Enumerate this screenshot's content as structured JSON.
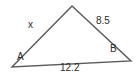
{
  "figure": {
    "type": "triangle-diagram",
    "stroke_color": "#5a5a5a",
    "text_color": "#2b2b2b",
    "background_color": "#ffffff",
    "vertices": [
      {
        "id": "apex",
        "label": "",
        "x": 72,
        "y": 6
      },
      {
        "id": "right",
        "label": "B",
        "x": 131,
        "y": 61
      },
      {
        "id": "left",
        "label": "A",
        "x": 12,
        "y": 67
      }
    ],
    "vertex_labels": {
      "a": "A",
      "b": "B"
    },
    "side_labels": {
      "left": "x",
      "right": "8.5",
      "base": "12.2"
    }
  }
}
